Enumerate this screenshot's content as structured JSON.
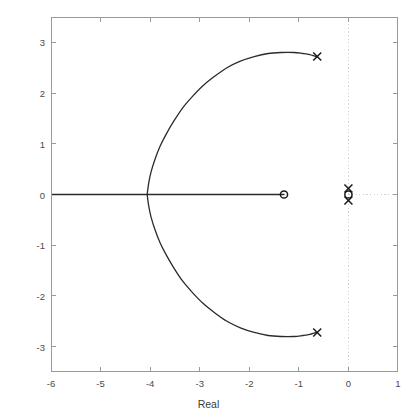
{
  "figure": {
    "background": "#ffffff",
    "axis_color": "#9a9a9a",
    "curve_color": "#2b2b2b",
    "grid_color": "#cfcfcf",
    "marker_color": "#1a1a1a"
  },
  "chart_data": {
    "type": "line",
    "title": "",
    "xlabel": "Real",
    "ylabel": "Imaginary",
    "xlim": [
      -6,
      1
    ],
    "ylim": [
      -3.5,
      3.5
    ],
    "xticks": [
      -6,
      -5,
      -4,
      -3,
      -2,
      -1,
      0,
      1
    ],
    "xtick_labels": [
      "-6",
      "-5",
      "-4",
      "-3",
      "-2",
      "-1",
      "0",
      "1"
    ],
    "yticks": [
      -3,
      -2,
      -1,
      0,
      1,
      2,
      3
    ],
    "ytick_labels": [
      "-3",
      "-2",
      "-1",
      "0",
      "1",
      "2",
      "3"
    ],
    "grid": false,
    "crosshair_lines": [
      {
        "orientation": "vertical",
        "value": 0,
        "style": "dotted"
      },
      {
        "orientation": "horizontal",
        "value": 0,
        "style": "dotted"
      }
    ],
    "legend": null,
    "series": [
      {
        "name": "root-locus-real-axis-branch",
        "style": "solid",
        "points": [
          [
            -6.0,
            0.0
          ],
          [
            -5.6,
            0.0
          ],
          [
            -5.2,
            0.0
          ],
          [
            -4.8,
            0.0
          ],
          [
            -4.4,
            0.0
          ],
          [
            -4.06,
            0.0
          ],
          [
            -3.6,
            0.0
          ],
          [
            -3.2,
            0.0
          ],
          [
            -2.8,
            0.0
          ],
          [
            -2.4,
            0.0
          ],
          [
            -2.0,
            0.0
          ],
          [
            -1.7,
            0.0
          ],
          [
            -1.45,
            0.0
          ],
          [
            -1.3,
            0.0
          ]
        ]
      },
      {
        "name": "root-locus-upper-branch",
        "style": "solid",
        "points": [
          [
            -4.06,
            0.0
          ],
          [
            -4.03,
            0.22
          ],
          [
            -3.98,
            0.45
          ],
          [
            -3.9,
            0.7
          ],
          [
            -3.8,
            0.95
          ],
          [
            -3.67,
            1.2
          ],
          [
            -3.52,
            1.45
          ],
          [
            -3.35,
            1.7
          ],
          [
            -3.15,
            1.93
          ],
          [
            -2.94,
            2.14
          ],
          [
            -2.7,
            2.33
          ],
          [
            -2.45,
            2.5
          ],
          [
            -2.18,
            2.63
          ],
          [
            -1.9,
            2.72
          ],
          [
            -1.62,
            2.78
          ],
          [
            -1.36,
            2.8
          ],
          [
            -1.1,
            2.8
          ],
          [
            -0.92,
            2.78
          ],
          [
            -0.78,
            2.76
          ],
          [
            -0.68,
            2.73
          ],
          [
            -0.63,
            2.72
          ]
        ]
      },
      {
        "name": "root-locus-lower-branch",
        "style": "solid",
        "points": [
          [
            -4.06,
            0.0
          ],
          [
            -4.03,
            -0.22
          ],
          [
            -3.98,
            -0.45
          ],
          [
            -3.9,
            -0.7
          ],
          [
            -3.8,
            -0.95
          ],
          [
            -3.67,
            -1.2
          ],
          [
            -3.52,
            -1.45
          ],
          [
            -3.35,
            -1.7
          ],
          [
            -3.15,
            -1.93
          ],
          [
            -2.94,
            -2.14
          ],
          [
            -2.7,
            -2.33
          ],
          [
            -2.45,
            -2.5
          ],
          [
            -2.18,
            -2.63
          ],
          [
            -1.9,
            -2.72
          ],
          [
            -1.62,
            -2.78
          ],
          [
            -1.36,
            -2.8
          ],
          [
            -1.1,
            -2.8
          ],
          [
            -0.92,
            -2.78
          ],
          [
            -0.78,
            -2.76
          ],
          [
            -0.68,
            -2.73
          ],
          [
            -0.63,
            -2.72
          ]
        ]
      }
    ],
    "markers": [
      {
        "name": "pole",
        "symbol": "x",
        "x": -0.63,
        "y": 2.72
      },
      {
        "name": "pole",
        "symbol": "x",
        "x": -0.63,
        "y": -2.72
      },
      {
        "name": "pole",
        "symbol": "x",
        "x": 0.0,
        "y": 0.12
      },
      {
        "name": "pole",
        "symbol": "x",
        "x": 0.0,
        "y": -0.12
      },
      {
        "name": "zero",
        "symbol": "o",
        "x": -1.3,
        "y": 0.0
      },
      {
        "name": "zero",
        "symbol": "o",
        "x": 0.0,
        "y": 0.0
      }
    ]
  }
}
